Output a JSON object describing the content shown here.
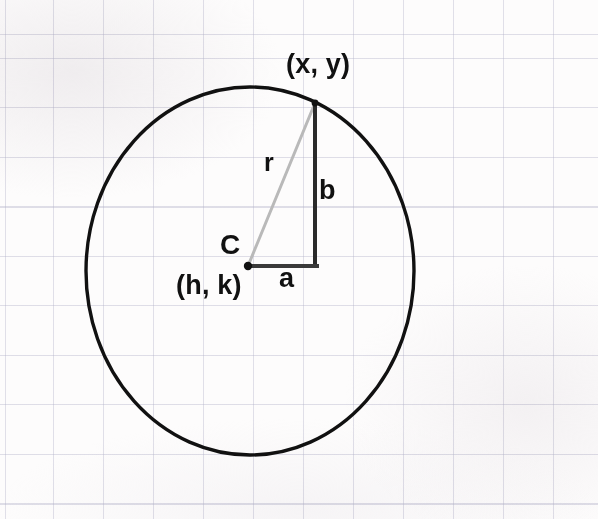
{
  "diagram": {
    "background_color": "#fdfcfc",
    "grid_color": "#b0b0c8",
    "stroke_color": "#111111",
    "radius_line_color": "#b5b5b5",
    "labels": {
      "point_on_circle": "(x, y)",
      "radius": "r",
      "vertical_leg": "b",
      "horizontal_leg": "a",
      "center_letter": "C",
      "center_coords": "(h, k)"
    },
    "geometry": {
      "circle_center_x": 250,
      "circle_center_y": 271,
      "circle_radius_x": 164,
      "circle_radius_y": 184,
      "center_point_x": 248,
      "center_point_y": 266,
      "corner_x": 315,
      "corner_y": 266,
      "point_x": 315,
      "point_y": 103
    }
  }
}
